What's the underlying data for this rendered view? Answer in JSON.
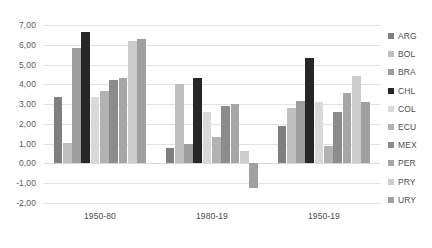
{
  "chart_data": {
    "type": "bar",
    "title": "",
    "subtitle": "",
    "xlabel": "",
    "ylabel": "",
    "categories": [
      "1950-80",
      "1980-19",
      "1950-19"
    ],
    "ylim": [
      -2.0,
      7.0
    ],
    "ytick_step": 1.0,
    "ytick_labels": [
      "7,00",
      "6,00",
      "5,00",
      "4,00",
      "3,00",
      "2,00",
      "1,00",
      "0,00",
      "-1,00",
      "-2,00"
    ],
    "ytick_values": [
      7.0,
      6.0,
      5.0,
      4.0,
      3.0,
      2.0,
      1.0,
      0.0,
      -1.0,
      -2.0
    ],
    "decimal_separator": ",",
    "grid": true,
    "grid_axis": "y",
    "legend_position": "right",
    "series": [
      {
        "name": "ARG",
        "color": "#7f7f7f",
        "values": [
          3.35,
          0.8,
          1.9
        ]
      },
      {
        "name": "BOL",
        "color": "#bfbfbf",
        "values": [
          1.05,
          4.0,
          2.8
        ]
      },
      {
        "name": "BRA",
        "color": "#9c9c9c",
        "values": [
          5.85,
          1.0,
          3.15
        ]
      },
      {
        "name": "CHL",
        "color": "#262626",
        "values": [
          6.65,
          4.3,
          5.35
        ]
      },
      {
        "name": "COL",
        "color": "#d9d9d9",
        "values": [
          3.35,
          2.6,
          3.1
        ]
      },
      {
        "name": "ECU",
        "color": "#b2b2b2",
        "values": [
          3.65,
          1.35,
          0.9
        ]
      },
      {
        "name": "MEX",
        "color": "#8c8c8c",
        "values": [
          4.2,
          2.9,
          2.6
        ]
      },
      {
        "name": "PER",
        "color": "#a6a6a6",
        "values": [
          4.3,
          3.0,
          3.55
        ]
      },
      {
        "name": "PRY",
        "color": "#cccccc",
        "values": [
          6.2,
          0.65,
          4.4
        ]
      },
      {
        "name": "URY",
        "color": "#a0a0a0",
        "values": [
          6.3,
          -1.25,
          3.1
        ]
      }
    ]
  }
}
